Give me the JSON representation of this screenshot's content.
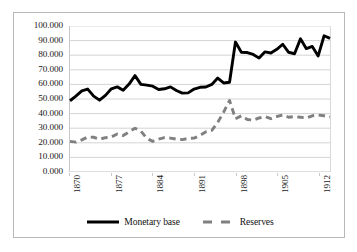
{
  "chart_data": {
    "type": "line",
    "title": "",
    "subtitle": "",
    "xlabel": "",
    "ylabel": "",
    "xlim": [
      1870,
      1914
    ],
    "ylim": [
      0,
      100
    ],
    "grid": "horizontal",
    "legend_position": "bottom",
    "y_ticks": [
      "100.000",
      "90.000",
      "80.000",
      "70.000",
      "60.000",
      "50.000",
      "40.000",
      "30.000",
      "20.000",
      "10.000",
      "0.000"
    ],
    "y_tick_values": [
      100,
      90,
      80,
      70,
      60,
      50,
      40,
      30,
      20,
      10,
      0
    ],
    "x_ticks": [
      "1870",
      "1877",
      "1884",
      "1891",
      "1898",
      "1905",
      "1912"
    ],
    "x_tick_values": [
      1870,
      1877,
      1884,
      1891,
      1898,
      1905,
      1912
    ],
    "x": [
      1870,
      1871,
      1872,
      1873,
      1874,
      1875,
      1876,
      1877,
      1878,
      1879,
      1880,
      1881,
      1882,
      1883,
      1884,
      1885,
      1886,
      1887,
      1888,
      1889,
      1890,
      1891,
      1892,
      1893,
      1894,
      1895,
      1896,
      1897,
      1898,
      1899,
      1900,
      1901,
      1902,
      1903,
      1904,
      1905,
      1906,
      1907,
      1908,
      1909,
      1910,
      1911,
      1912,
      1913,
      1914
    ],
    "series": [
      {
        "name": "Monetary base",
        "style": "solid",
        "color": "#000000",
        "width": 2.9,
        "values": [
          48.8,
          52.0,
          55.5,
          56.8,
          52.0,
          49.2,
          52.5,
          57.0,
          58.3,
          56.0,
          60.2,
          66.0,
          60.0,
          59.5,
          58.8,
          56.5,
          57.0,
          58.3,
          55.8,
          54.0,
          54.2,
          56.8,
          58.0,
          58.2,
          60.0,
          64.3,
          61.0,
          61.5,
          89.0,
          82.0,
          81.8,
          80.5,
          78.0,
          82.3,
          81.5,
          84.0,
          87.5,
          82.0,
          81.0,
          91.2,
          84.5,
          86.0,
          79.5,
          93.3,
          91.5
        ]
      },
      {
        "name": "Reserves",
        "style": "dashed",
        "color": "#808080",
        "width": 2.9,
        "values": [
          21.0,
          20.5,
          22.0,
          24.0,
          23.8,
          22.5,
          23.5,
          24.0,
          26.0,
          25.0,
          27.5,
          30.0,
          28.0,
          23.0,
          21.0,
          22.5,
          23.5,
          23.2,
          22.5,
          22.2,
          23.0,
          23.2,
          25.0,
          27.5,
          28.5,
          34.0,
          41.0,
          49.0,
          36.5,
          38.5,
          36.0,
          35.5,
          37.0,
          38.0,
          36.5,
          38.0,
          39.0,
          37.5,
          38.0,
          37.5,
          37.0,
          38.5,
          39.0,
          38.5,
          37.8
        ]
      }
    ]
  },
  "legend": {
    "entries": [
      {
        "label": "Monetary base",
        "style": "solid"
      },
      {
        "label": "Reserves",
        "style": "dashed"
      }
    ]
  }
}
